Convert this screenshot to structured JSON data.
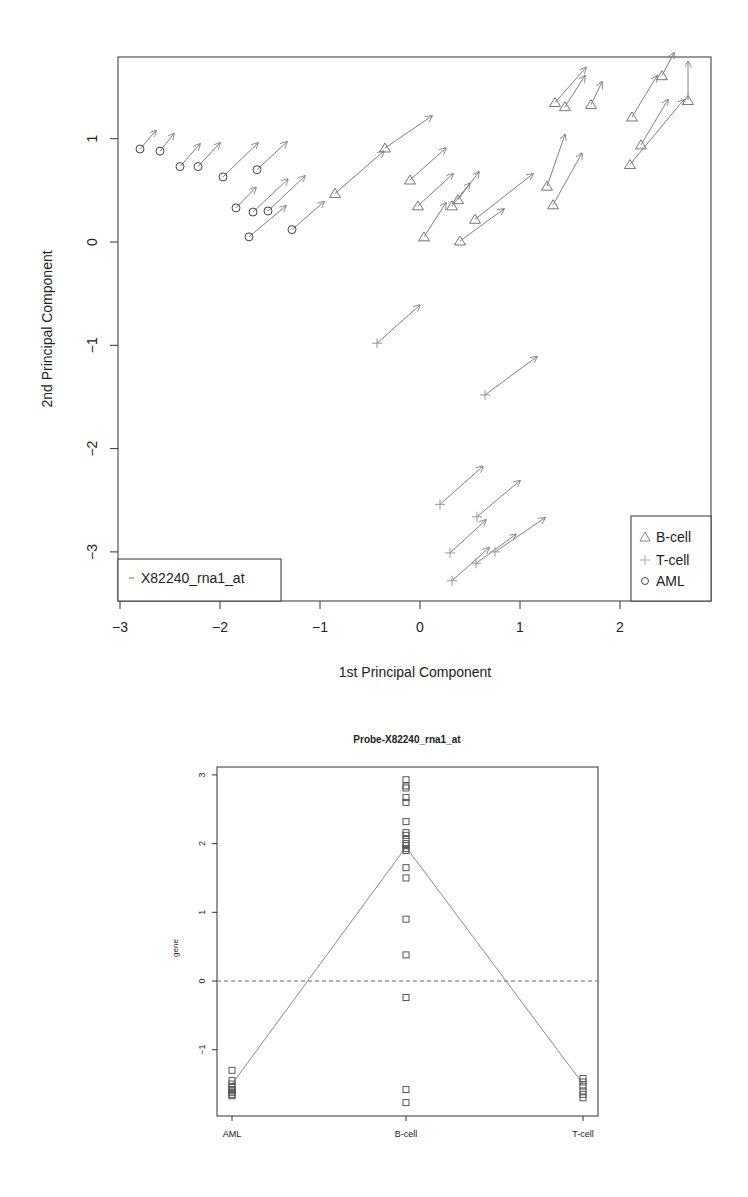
{
  "chart_data": [
    {
      "type": "scatter",
      "subtype": "biplot-arrows",
      "title": "",
      "xlabel": "1st Principal Component",
      "ylabel": "2nd Principal Component",
      "xlim": [
        -3.0,
        2.9
      ],
      "ylim": [
        -3.5,
        1.8
      ],
      "xticks": [
        "-3",
        "-2",
        "-1",
        "0",
        "1",
        "2"
      ],
      "yticks": [
        "1",
        "0",
        "-1",
        "-2",
        "-3"
      ],
      "grid": false,
      "legend_groups": {
        "position": "bottomright",
        "entries": [
          {
            "label": "B-cell",
            "marker": "triangle"
          },
          {
            "label": "T-cell",
            "marker": "plus"
          },
          {
            "label": "AML",
            "marker": "circle"
          }
        ]
      },
      "legend_gene": {
        "position": "bottomleft",
        "entries": [
          {
            "label": "X82240_rna1_at",
            "marker": "dash"
          }
        ]
      },
      "series": [
        {
          "name": "AML",
          "marker": "circle",
          "points": [
            {
              "x": -2.8,
              "y": 0.9,
              "dx": 0.16,
              "dy": 0.18
            },
            {
              "x": -2.6,
              "y": 0.88,
              "dx": 0.14,
              "dy": 0.17
            },
            {
              "x": -2.4,
              "y": 0.73,
              "dx": 0.2,
              "dy": 0.22
            },
            {
              "x": -2.22,
              "y": 0.73,
              "dx": 0.22,
              "dy": 0.23
            },
            {
              "x": -1.97,
              "y": 0.63,
              "dx": 0.35,
              "dy": 0.33
            },
            {
              "x": -1.63,
              "y": 0.7,
              "dx": 0.3,
              "dy": 0.27
            },
            {
              "x": -1.84,
              "y": 0.33,
              "dx": 0.2,
              "dy": 0.2
            },
            {
              "x": -1.67,
              "y": 0.29,
              "dx": 0.35,
              "dy": 0.32
            },
            {
              "x": -1.52,
              "y": 0.3,
              "dx": 0.37,
              "dy": 0.34
            },
            {
              "x": -1.71,
              "y": 0.05,
              "dx": 0.37,
              "dy": 0.3
            },
            {
              "x": -1.28,
              "y": 0.12,
              "dx": 0.32,
              "dy": 0.27
            }
          ]
        },
        {
          "name": "B-cell",
          "marker": "triangle",
          "points": [
            {
              "x": -0.85,
              "y": 0.47,
              "dx": 0.49,
              "dy": 0.41
            },
            {
              "x": -0.35,
              "y": 0.91,
              "dx": 0.47,
              "dy": 0.31
            },
            {
              "x": -0.1,
              "y": 0.6,
              "dx": 0.36,
              "dy": 0.31
            },
            {
              "x": -0.02,
              "y": 0.35,
              "dx": 0.35,
              "dy": 0.31
            },
            {
              "x": 0.04,
              "y": 0.05,
              "dx": 0.22,
              "dy": 0.33
            },
            {
              "x": 0.32,
              "y": 0.35,
              "dx": 0.18,
              "dy": 0.22
            },
            {
              "x": 0.38,
              "y": 0.41,
              "dx": 0.21,
              "dy": 0.27
            },
            {
              "x": 0.55,
              "y": 0.22,
              "dx": 0.58,
              "dy": 0.44
            },
            {
              "x": 0.4,
              "y": 0.01,
              "dx": 0.44,
              "dy": 0.31
            },
            {
              "x": 1.27,
              "y": 0.54,
              "dx": 0.18,
              "dy": 0.5
            },
            {
              "x": 1.33,
              "y": 0.36,
              "dx": 0.29,
              "dy": 0.5
            },
            {
              "x": 1.35,
              "y": 1.35,
              "dx": 0.31,
              "dy": 0.34
            },
            {
              "x": 1.45,
              "y": 1.31,
              "dx": 0.2,
              "dy": 0.3
            },
            {
              "x": 1.71,
              "y": 1.33,
              "dx": 0.11,
              "dy": 0.22
            },
            {
              "x": 2.12,
              "y": 1.21,
              "dx": 0.25,
              "dy": 0.4
            },
            {
              "x": 2.42,
              "y": 1.61,
              "dx": 0.12,
              "dy": 0.22
            },
            {
              "x": 2.68,
              "y": 1.37,
              "dx": 0.0,
              "dy": 0.38
            },
            {
              "x": 2.21,
              "y": 0.94,
              "dx": 0.27,
              "dy": 0.44
            },
            {
              "x": 2.1,
              "y": 0.75,
              "dx": 0.54,
              "dy": 0.63
            }
          ]
        },
        {
          "name": "T-cell",
          "marker": "plus",
          "points": [
            {
              "x": -0.43,
              "y": -0.98,
              "dx": 0.43,
              "dy": 0.37
            },
            {
              "x": 0.65,
              "y": -1.48,
              "dx": 0.52,
              "dy": 0.37
            },
            {
              "x": 0.2,
              "y": -2.54,
              "dx": 0.43,
              "dy": 0.37
            },
            {
              "x": 0.57,
              "y": -2.66,
              "dx": 0.43,
              "dy": 0.35
            },
            {
              "x": 0.3,
              "y": -3.01,
              "dx": 0.36,
              "dy": 0.32
            },
            {
              "x": 0.32,
              "y": -3.28,
              "dx": 0.37,
              "dy": 0.32
            },
            {
              "x": 0.56,
              "y": -3.11,
              "dx": 0.4,
              "dy": 0.28
            },
            {
              "x": 0.75,
              "y": -3.0,
              "dx": 0.5,
              "dy": 0.33
            }
          ]
        }
      ]
    },
    {
      "type": "scatter",
      "subtype": "strip-with-mean-line",
      "title": "Probe-X82240_rna1_at",
      "xlabel": "",
      "ylabel": "gene",
      "ylim": [
        -1.95,
        3.1
      ],
      "categories": [
        "AML",
        "B-cell",
        "T-cell"
      ],
      "yticks": [
        "3",
        "2",
        "1",
        "0",
        "-1"
      ],
      "reference_line": {
        "y": 0,
        "style": "dashed"
      },
      "mean_line": {
        "values": [
          -1.5,
          1.95,
          -1.5
        ]
      },
      "series": [
        {
          "name": "AML",
          "values": [
            -1.3,
            -1.45,
            -1.5,
            -1.55,
            -1.58,
            -1.6,
            -1.62,
            -1.65,
            -1.67
          ]
        },
        {
          "name": "B-cell",
          "values": [
            2.93,
            2.84,
            2.81,
            2.67,
            2.6,
            2.32,
            2.16,
            2.12,
            2.06,
            2.0,
            1.97,
            1.93,
            1.9,
            1.65,
            1.5,
            0.9,
            0.38,
            -0.24,
            -1.58,
            -1.77
          ]
        },
        {
          "name": "T-cell",
          "values": [
            -1.42,
            -1.47,
            -1.53,
            -1.6,
            -1.65,
            -1.7
          ]
        }
      ]
    }
  ],
  "styles": {
    "arrow_color": "#808080",
    "marker_group_color": "#777777",
    "aml_marker_color": "#444444",
    "axis_color": "#333333"
  }
}
